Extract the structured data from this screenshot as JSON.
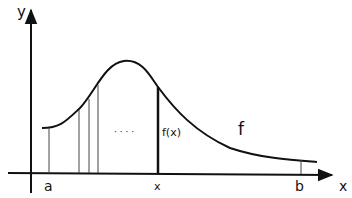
{
  "diagram": {
    "title": "",
    "axis_labels": {
      "x": "x",
      "y": "y"
    },
    "tick_labels": {
      "a": "a",
      "x": "x",
      "b": "b"
    },
    "function_label": "f",
    "value_label": "f(x)",
    "ellipsis": "· · · ·",
    "colors": {
      "stroke": "#111111",
      "background": "#ffffff",
      "thin_line": "#444444"
    }
  }
}
